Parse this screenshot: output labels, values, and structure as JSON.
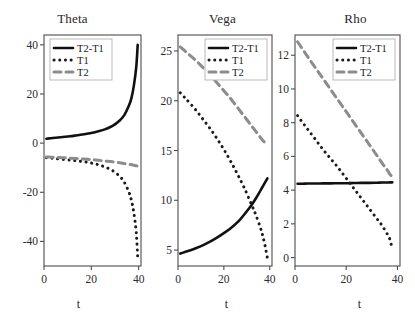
{
  "figure": {
    "background": "#ffffff",
    "width": 415,
    "height": 318,
    "series_colors": {
      "T2-T1": "#111111",
      "T1": "#1a1a1a",
      "T2": "#8c8c8c"
    }
  },
  "axis_label_x": "t",
  "legend": {
    "entries": [
      {
        "label": "T2-T1",
        "style": "solid"
      },
      {
        "label": "T1",
        "style": "dotted"
      },
      {
        "label": "T2",
        "style": "dashed"
      }
    ]
  },
  "panels": [
    {
      "title": "Theta",
      "axis_label_x": "t"
    },
    {
      "title": "Vega",
      "axis_label_x": "t"
    },
    {
      "title": "Rho",
      "axis_label_x": "t"
    }
  ],
  "chart_data": [
    {
      "type": "line",
      "title": "Theta",
      "xlabel": "t",
      "ylabel": "",
      "xlim": [
        0,
        41
      ],
      "ylim": [
        -50,
        44
      ],
      "xticks": [
        0,
        20,
        40
      ],
      "yticks": [
        -40,
        -20,
        0,
        20,
        40
      ],
      "grid": false,
      "legend_position": "upper-left",
      "x": [
        1,
        3,
        5,
        8,
        11,
        14,
        17,
        20,
        23,
        26,
        29,
        32,
        34,
        36,
        37,
        38,
        39,
        39.6
      ],
      "series": [
        {
          "name": "T2-T1",
          "style": "solid",
          "color": "#111111",
          "values": [
            1.8,
            2.0,
            2.2,
            2.5,
            2.8,
            3.2,
            3.6,
            4.1,
            4.8,
            5.7,
            7.0,
            9.2,
            11.5,
            15.5,
            18.5,
            23.5,
            31.0,
            40.0
          ]
        },
        {
          "name": "T1",
          "style": "dotted",
          "color": "#1a1a1a",
          "values": [
            -5.9,
            -6.1,
            -6.3,
            -6.6,
            -6.9,
            -7.2,
            -7.6,
            -8.1,
            -8.8,
            -9.8,
            -11.2,
            -13.5,
            -16.0,
            -20.2,
            -23.5,
            -28.5,
            -36.5,
            -46.5
          ]
        },
        {
          "name": "T2",
          "style": "dashed",
          "color": "#8c8c8c",
          "values": [
            -5.6,
            -5.7,
            -5.8,
            -5.9,
            -6.1,
            -6.3,
            -6.5,
            -6.7,
            -7.0,
            -7.3,
            -7.6,
            -8.0,
            -8.3,
            -8.6,
            -8.8,
            -9.0,
            -9.2,
            -9.4
          ]
        }
      ]
    },
    {
      "type": "line",
      "title": "Vega",
      "xlabel": "t",
      "ylabel": "",
      "xlim": [
        0,
        41
      ],
      "ylim": [
        3.4,
        26.6
      ],
      "xticks": [
        0,
        20,
        40
      ],
      "yticks": [
        5,
        10,
        15,
        20,
        25
      ],
      "grid": false,
      "legend_position": "upper-right",
      "x": [
        1,
        3,
        5,
        8,
        11,
        14,
        17,
        20,
        23,
        26,
        29,
        32,
        34,
        36,
        37,
        38,
        39
      ],
      "series": [
        {
          "name": "T2-T1",
          "style": "solid",
          "color": "#111111",
          "values": [
            4.65,
            4.8,
            4.95,
            5.2,
            5.5,
            5.85,
            6.25,
            6.7,
            7.2,
            7.8,
            8.6,
            9.5,
            10.2,
            11.0,
            11.4,
            11.8,
            12.2
          ]
        },
        {
          "name": "T1",
          "style": "dotted",
          "color": "#1a1a1a",
          "values": [
            20.8,
            20.3,
            19.8,
            19.0,
            18.1,
            17.2,
            16.2,
            15.1,
            13.9,
            12.6,
            11.2,
            9.6,
            8.5,
            7.2,
            6.4,
            5.4,
            4.2
          ]
        },
        {
          "name": "T2",
          "style": "dashed",
          "color": "#8c8c8c",
          "values": [
            25.4,
            25.0,
            24.6,
            24.0,
            23.3,
            22.6,
            21.8,
            21.0,
            20.2,
            19.3,
            18.4,
            17.5,
            16.9,
            16.3,
            16.0,
            15.8,
            15.6
          ]
        }
      ]
    },
    {
      "type": "line",
      "title": "Rho",
      "xlabel": "t",
      "ylabel": "",
      "xlim": [
        0,
        41
      ],
      "ylim": [
        -0.5,
        13.2
      ],
      "xticks": [
        0,
        20,
        40
      ],
      "yticks": [
        0,
        2,
        4,
        6,
        8,
        10,
        12
      ],
      "grid": false,
      "legend_position": "upper-right",
      "x": [
        1,
        3,
        5,
        8,
        11,
        14,
        17,
        20,
        23,
        26,
        29,
        32,
        34,
        36,
        37,
        38
      ],
      "series": [
        {
          "name": "T2-T1",
          "style": "solid",
          "color": "#111111",
          "values": [
            4.38,
            4.38,
            4.39,
            4.39,
            4.4,
            4.4,
            4.41,
            4.41,
            4.42,
            4.43,
            4.43,
            4.44,
            4.45,
            4.45,
            4.46,
            4.46
          ]
        },
        {
          "name": "T1",
          "style": "dotted",
          "color": "#1a1a1a",
          "values": [
            8.42,
            8.0,
            7.6,
            7.0,
            6.4,
            5.85,
            5.3,
            4.7,
            4.1,
            3.5,
            2.9,
            2.3,
            1.9,
            1.4,
            1.1,
            0.5
          ]
        },
        {
          "name": "T2",
          "style": "dashed",
          "color": "#8c8c8c",
          "values": [
            12.8,
            12.35,
            11.9,
            11.25,
            10.6,
            9.95,
            9.3,
            8.65,
            8.0,
            7.35,
            6.7,
            6.05,
            5.6,
            5.2,
            4.95,
            4.8
          ]
        }
      ]
    }
  ]
}
